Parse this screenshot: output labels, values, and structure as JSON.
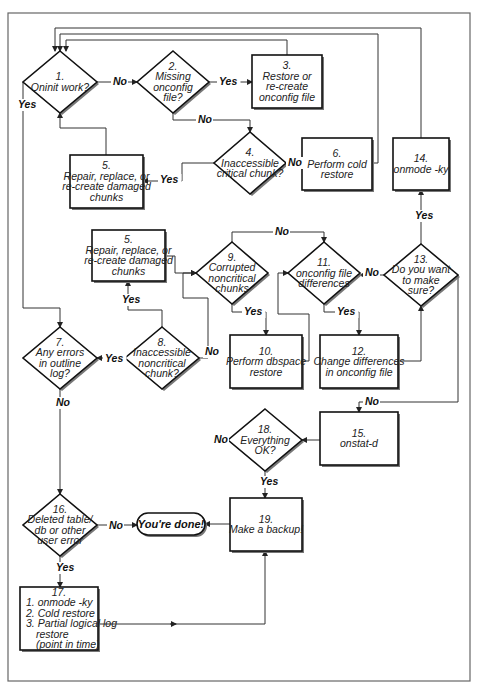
{
  "diagram": {
    "title": "",
    "nodes": [
      {
        "id": "n1",
        "type": "decision",
        "cx": 60,
        "cy": 82,
        "w": 74,
        "h": 62,
        "lines": [
          "1.",
          "Oninit work?"
        ]
      },
      {
        "id": "n2",
        "type": "decision",
        "cx": 173,
        "cy": 82,
        "w": 72,
        "h": 62,
        "lines": [
          "2.",
          "Missing",
          "onconfig",
          "file?"
        ]
      },
      {
        "id": "n3",
        "type": "process",
        "x": 252,
        "y": 55,
        "w": 70,
        "h": 53,
        "lines": [
          "3.",
          "Restore or",
          "re-create",
          "onconfig file"
        ]
      },
      {
        "id": "n4",
        "type": "decision",
        "cx": 250,
        "cy": 163,
        "w": 72,
        "h": 62,
        "lines": [
          "4.",
          "Inaccessible",
          "critical chunk?"
        ]
      },
      {
        "id": "n5a",
        "type": "process",
        "x": 70,
        "y": 155,
        "w": 73,
        "h": 53,
        "lines": [
          "5.",
          "Repair, replace, or",
          "re-create damaged",
          "chunks"
        ]
      },
      {
        "id": "n6",
        "type": "process",
        "x": 302,
        "y": 138,
        "w": 70,
        "h": 52,
        "lines": [
          "6.",
          "Perform cold",
          "restore"
        ]
      },
      {
        "id": "n14",
        "type": "process",
        "x": 393,
        "y": 138,
        "w": 56,
        "h": 52,
        "lines": [
          "14.",
          "onmode -ky"
        ]
      },
      {
        "id": "n5b",
        "type": "process",
        "x": 92,
        "y": 230,
        "w": 73,
        "h": 51,
        "lines": [
          "5.",
          "Repair, replace, or",
          "re-create damaged",
          "chunks"
        ]
      },
      {
        "id": "n9",
        "type": "decision",
        "cx": 232,
        "cy": 273,
        "w": 72,
        "h": 62,
        "lines": [
          "9.",
          "Corrupted",
          "noncritical",
          "chunks"
        ]
      },
      {
        "id": "n11",
        "type": "decision",
        "cx": 324,
        "cy": 273,
        "w": 72,
        "h": 62,
        "lines": [
          "11.",
          "onconfig file",
          "differences"
        ]
      },
      {
        "id": "n13",
        "type": "decision",
        "cx": 421,
        "cy": 275,
        "w": 74,
        "h": 62,
        "lines": [
          "13.",
          "Do you want",
          "to make",
          "sure?"
        ]
      },
      {
        "id": "n7",
        "type": "decision",
        "cx": 60,
        "cy": 358,
        "w": 74,
        "h": 62,
        "lines": [
          "7.",
          "Any errors",
          "in outline",
          "log?"
        ]
      },
      {
        "id": "n8",
        "type": "decision",
        "cx": 162,
        "cy": 358,
        "w": 74,
        "h": 62,
        "lines": [
          "8.",
          "Inaccessible",
          "noncritical",
          "chunk?"
        ]
      },
      {
        "id": "n10",
        "type": "process",
        "x": 230,
        "y": 335,
        "w": 72,
        "h": 53,
        "lines": [
          "10.",
          "Perform dbspace",
          "restore"
        ]
      },
      {
        "id": "n12",
        "type": "process",
        "x": 320,
        "y": 335,
        "w": 78,
        "h": 53,
        "lines": [
          "12.",
          "Change differences",
          "in onconfig file"
        ]
      },
      {
        "id": "n15",
        "type": "process",
        "x": 320,
        "y": 412,
        "w": 78,
        "h": 53,
        "lines": [
          "15.",
          "onstat-d"
        ]
      },
      {
        "id": "n18",
        "type": "decision",
        "cx": 265,
        "cy": 440,
        "w": 74,
        "h": 62,
        "lines": [
          "18.",
          "Everything",
          "OK?"
        ]
      },
      {
        "id": "n16",
        "type": "decision",
        "cx": 60,
        "cy": 525,
        "w": 74,
        "h": 62,
        "lines": [
          "16.",
          "Deleted table/",
          "db or other",
          "user error"
        ]
      },
      {
        "id": "done",
        "type": "terminal",
        "x": 137,
        "y": 513,
        "w": 68,
        "h": 22,
        "lines": [
          "You're done!"
        ]
      },
      {
        "id": "n19",
        "type": "process",
        "x": 230,
        "y": 498,
        "w": 72,
        "h": 53,
        "lines": [
          "19.",
          "Make a backup!"
        ]
      },
      {
        "id": "n17",
        "type": "process",
        "x": 20,
        "y": 587,
        "w": 78,
        "h": 63,
        "lines": [
          "17.",
          "1. onmode -ky",
          "2. Cold restore",
          "3. Partial logical log",
          "restore",
          "(point in time)"
        ]
      }
    ],
    "edge_labels": [
      {
        "text": "No",
        "x": 113,
        "y": 85
      },
      {
        "text": "Yes",
        "x": 219,
        "y": 85
      },
      {
        "text": "No",
        "x": 198,
        "y": 123
      },
      {
        "text": "Yes",
        "x": 160,
        "y": 183
      },
      {
        "text": "No",
        "x": 288,
        "y": 166
      },
      {
        "text": "Yes",
        "x": 18,
        "y": 108
      },
      {
        "text": "Yes",
        "x": 415,
        "y": 219
      },
      {
        "text": "No",
        "x": 275,
        "y": 235
      },
      {
        "text": "No",
        "x": 365,
        "y": 276
      },
      {
        "text": "Yes",
        "x": 244,
        "y": 315
      },
      {
        "text": "Yes",
        "x": 337,
        "y": 315
      },
      {
        "text": "Yes",
        "x": 122,
        "y": 303
      },
      {
        "text": "No",
        "x": 205,
        "y": 355
      },
      {
        "text": "Yes",
        "x": 105,
        "y": 362
      },
      {
        "text": "No",
        "x": 56,
        "y": 406
      },
      {
        "text": "No",
        "x": 365,
        "y": 405
      },
      {
        "text": "No",
        "x": 214,
        "y": 443
      },
      {
        "text": "Yes",
        "x": 260,
        "y": 485
      },
      {
        "text": "No",
        "x": 109,
        "y": 529
      },
      {
        "text": "Yes",
        "x": 56,
        "y": 571
      }
    ]
  }
}
